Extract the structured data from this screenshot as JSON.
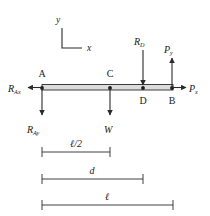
{
  "diagram": {
    "stroke_color": "#2b2b2b",
    "beam_fill": "#d9d9d9",
    "text_color": "#1a1a1a"
  },
  "axes": {
    "y_label": "y",
    "x_label": "x"
  },
  "points": [
    {
      "id": "A",
      "label": "A",
      "x": 42,
      "label_pos": "above"
    },
    {
      "id": "C",
      "label": "C",
      "x": 110,
      "label_pos": "above"
    },
    {
      "id": "D",
      "label": "D",
      "x": 143,
      "label_pos": "below"
    },
    {
      "id": "B",
      "label": "B",
      "x": 172,
      "label_pos": "below"
    }
  ],
  "forces": [
    {
      "id": "RAx",
      "base": "R",
      "sub": "Ax",
      "at": "A",
      "direction": "left"
    },
    {
      "id": "RAy",
      "base": "R",
      "sub": "Ay",
      "at": "A",
      "direction": "down"
    },
    {
      "id": "W",
      "base": "W",
      "sub": "",
      "at": "C",
      "direction": "down"
    },
    {
      "id": "RD",
      "base": "R",
      "sub": "D",
      "at": "D",
      "direction": "down"
    },
    {
      "id": "Py",
      "base": "P",
      "sub": "y",
      "at": "B",
      "direction": "up"
    },
    {
      "id": "Px",
      "base": "P",
      "sub": "x",
      "at": "B",
      "direction": "right"
    }
  ],
  "dimensions": [
    {
      "id": "half-length",
      "label": "ℓ/2",
      "from": "A",
      "to": "C",
      "x1": 42,
      "x2": 110,
      "y": 152
    },
    {
      "id": "distance-d",
      "label": "d",
      "from": "A",
      "to": "D",
      "x1": 42,
      "x2": 143,
      "y": 179
    },
    {
      "id": "length",
      "label": "ℓ",
      "from": "A",
      "to": "B",
      "x1": 42,
      "x2": 173,
      "y": 205
    }
  ]
}
